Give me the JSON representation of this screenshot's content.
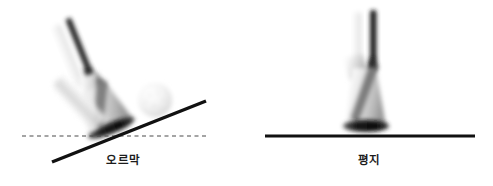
{
  "figure": {
    "background_color": "#ffffff",
    "width": 493,
    "height": 186,
    "line_color": "#111111",
    "reference_line_color": "#4a4a4a"
  },
  "panels": [
    {
      "id": "uphill",
      "caption": "오르막",
      "slope_line": {
        "kind": "solid",
        "x1": 52,
        "y1": 162,
        "x2": 206,
        "y2": 101,
        "thickness": 3.4
      },
      "reference_line": {
        "kind": "dashed",
        "x1": 22,
        "y1": 136,
        "x2": 206,
        "y2": 136,
        "thickness": 1.1
      },
      "ball": {
        "visible": true,
        "cx": 155,
        "cy": 100,
        "r": 17,
        "color": "#f2f2f2"
      },
      "club": {
        "tilt_degrees": -22,
        "pivot_x": 112,
        "pivot_y": 130
      }
    },
    {
      "id": "flat",
      "caption": "평지",
      "slope_line": {
        "kind": "solid",
        "x1": 19,
        "y1": 136,
        "x2": 229,
        "y2": 136,
        "thickness": 3.0
      },
      "reference_line": null,
      "ball": {
        "visible": false
      },
      "club": {
        "tilt_degrees": 0,
        "pivot_x": 123,
        "pivot_y": 132
      }
    }
  ]
}
